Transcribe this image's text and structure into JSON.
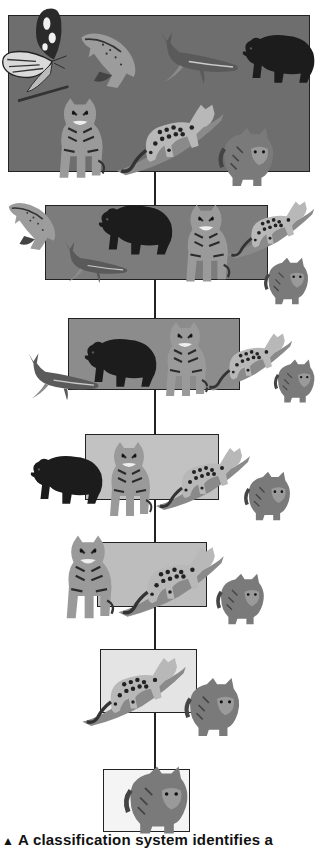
{
  "figure": {
    "type": "classification-hierarchy",
    "levels": [
      {
        "level": 1,
        "fill": "#6e6e6e",
        "members": [
          "butterfly",
          "trout",
          "humpback whale",
          "bear",
          "tiger",
          "ocelot",
          "house cat"
        ]
      },
      {
        "level": 2,
        "fill": "#7c7c7c",
        "members": [
          "trout",
          "humpback whale",
          "bear",
          "tiger",
          "ocelot",
          "house cat"
        ]
      },
      {
        "level": 3,
        "fill": "#8c8c8c",
        "members": [
          "humpback whale",
          "bear",
          "tiger",
          "ocelot",
          "house cat"
        ]
      },
      {
        "level": 4,
        "fill": "#c2c2c2",
        "members": [
          "bear",
          "tiger",
          "ocelot",
          "house cat"
        ]
      },
      {
        "level": 5,
        "fill": "#bdbdbd",
        "members": [
          "tiger",
          "ocelot",
          "house cat"
        ]
      },
      {
        "level": 6,
        "fill": "#e4e4e4",
        "members": [
          "ocelot",
          "house cat"
        ]
      },
      {
        "level": 7,
        "fill": "#f4f4f4",
        "members": [
          "house cat"
        ]
      }
    ]
  },
  "caption": {
    "marker": "▲",
    "text": "A classification system identifies a"
  }
}
